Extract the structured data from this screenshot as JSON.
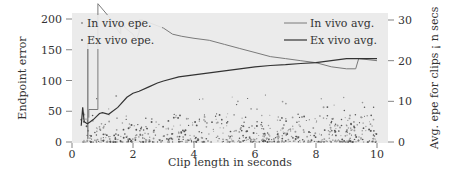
{
  "chart_data": {
    "type": "line",
    "title": "",
    "xlabel": "Clip length in seconds",
    "ylabel": "Endpoint error",
    "y2label": "Avg. epe for clips ¡ n secs",
    "xlim": [
      0,
      10.4
    ],
    "ylim": [
      0,
      210
    ],
    "y2lim": [
      0,
      31.5
    ],
    "xticks": [
      0,
      2,
      4,
      6,
      8,
      10
    ],
    "yticks": [
      0,
      50,
      100,
      150,
      200
    ],
    "y2ticks": [
      0,
      10,
      20,
      30
    ],
    "grid": false,
    "legend_left": {
      "position": "upper left",
      "entries": [
        "In vivo epe.",
        "Ex vivo epe."
      ]
    },
    "legend_right": {
      "position": "upper right",
      "entries": [
        "In vivo avg.",
        "Ex vivo avg."
      ]
    },
    "series": [
      {
        "name": "In vivo avg.",
        "axis": "right",
        "color": "#777777",
        "x": [
          0.55,
          0.55,
          0.85,
          0.85,
          1.3,
          1.5,
          1.6,
          1.6,
          1.75,
          2.0,
          2.1,
          2.2,
          2.2,
          2.3,
          3.0,
          3.3,
          3.6,
          4.0,
          4.5,
          5.0,
          5.5,
          6.0,
          6.5,
          7.0,
          7.5,
          8.0,
          8.5,
          9.0,
          9.3,
          9.4,
          10.0
        ],
        "values": [
          6,
          8,
          8,
          34,
          30,
          27.5,
          26.5,
          30,
          28,
          26.5,
          25,
          27,
          30,
          30,
          28,
          26.5,
          26,
          25.5,
          25,
          24,
          23,
          22,
          21,
          20.5,
          20,
          19.5,
          18.5,
          18,
          18,
          20.5,
          20
        ]
      },
      {
        "name": "Ex vivo avg.",
        "axis": "right",
        "color": "#333333",
        "x": [
          0.3,
          0.35,
          0.4,
          0.5,
          0.6,
          0.7,
          0.9,
          1.0,
          1.2,
          1.5,
          1.8,
          2.0,
          2.2,
          2.5,
          2.8,
          3.0,
          3.5,
          4.0,
          4.5,
          5.0,
          5.5,
          6.0,
          6.5,
          7.0,
          7.5,
          8.0,
          8.5,
          9.0,
          9.5,
          10.0
        ],
        "values": [
          4,
          8.5,
          5,
          4.5,
          5,
          5.5,
          7,
          7.2,
          6.8,
          8.5,
          11,
          12,
          12.5,
          13.5,
          14.5,
          15,
          16,
          16.5,
          17,
          17.5,
          18,
          18.5,
          18.8,
          19,
          19.3,
          19.5,
          20,
          20.5,
          20.5,
          20.5
        ]
      },
      {
        "name": "In vivo epe.",
        "axis": "left",
        "type": "scatter",
        "color": "#888888",
        "note": "dense scatter of small points, mostly 0–30 epe, sparse up to ~130"
      },
      {
        "name": "Ex vivo epe.",
        "axis": "left",
        "type": "scatter",
        "color": "#444444",
        "note": "dense scatter of small points, mostly 0–25 epe"
      }
    ]
  }
}
